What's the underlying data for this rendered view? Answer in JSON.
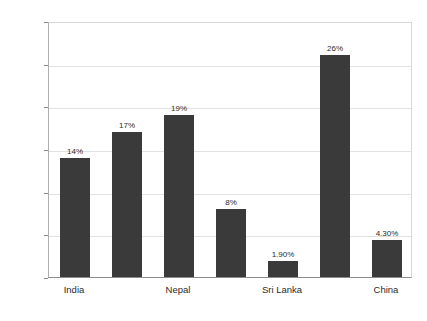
{
  "chart_data": {
    "type": "bar",
    "title": "",
    "xlabel": "",
    "ylabel": "",
    "categories": [
      "India",
      "",
      "Nepal",
      "",
      "Sri Lanka",
      "",
      "China"
    ],
    "visible_tick_labels": [
      "India",
      "Nepal",
      "Sri Lanka",
      "China"
    ],
    "values": [
      14,
      17,
      19,
      8,
      1.9,
      26,
      4.3
    ],
    "value_labels": [
      "14%",
      "17%",
      "19%",
      "8%",
      "1.90%",
      "26%",
      "4.30%"
    ],
    "ylim": [
      0,
      30
    ],
    "ytick_values": [
      0,
      5,
      10,
      15,
      20,
      25,
      30
    ],
    "ytick_labels": [
      "0%",
      "5%",
      "10%",
      "15%",
      "20%",
      "25%",
      "30%"
    ],
    "grid": true,
    "grid_axis": "y",
    "legend": false,
    "legend_position": "none",
    "bar_color": "#3a3a3a",
    "background_color": "#ffffff",
    "gridline_color": "#e2e2e2",
    "axis_color": "#8c8c8c"
  }
}
